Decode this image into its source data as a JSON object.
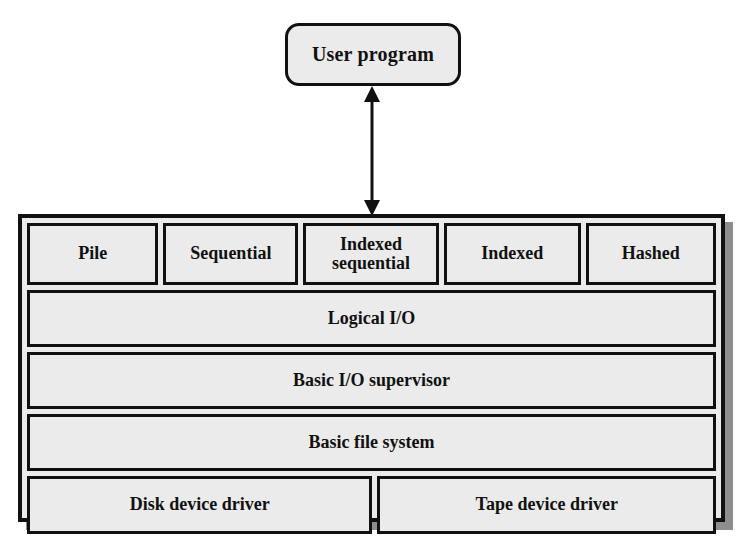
{
  "diagram": {
    "colors": {
      "fill": "#ebebeb",
      "stroke": "#111111",
      "shadow": "#8e8e8e",
      "background": "#ffffff"
    },
    "user_program": {
      "label": "User program"
    },
    "connector": {
      "name": "double-headed vertical arrow",
      "direction": "bidirectional",
      "from": "User program",
      "to": "Access method layer"
    },
    "stack": {
      "rows": [
        {
          "type": "access-methods",
          "cells": [
            {
              "label": "Pile"
            },
            {
              "label": "Sequential"
            },
            {
              "label": "Indexed\nsequential",
              "line1": "Indexed",
              "line2": "sequential"
            },
            {
              "label": "Indexed"
            },
            {
              "label": "Hashed"
            }
          ]
        },
        {
          "type": "full",
          "cells": [
            {
              "label": "Logical I/O"
            }
          ]
        },
        {
          "type": "full",
          "cells": [
            {
              "label": "Basic I/O supervisor"
            }
          ]
        },
        {
          "type": "full",
          "cells": [
            {
              "label": "Basic file system"
            }
          ]
        },
        {
          "type": "drivers",
          "cells": [
            {
              "label": "Disk device driver"
            },
            {
              "label": "Tape device driver"
            }
          ]
        }
      ]
    }
  }
}
